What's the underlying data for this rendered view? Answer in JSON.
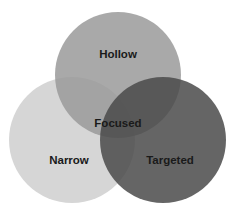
{
  "diagram": {
    "type": "venn",
    "circles": [
      {
        "id": "hollow",
        "label": "Hollow",
        "cx": 118,
        "cy": 75,
        "r": 63,
        "color": "#a0a0a0",
        "label_x": 118,
        "label_y": 58
      },
      {
        "id": "narrow",
        "label": "Narrow",
        "cx": 72,
        "cy": 140,
        "r": 63,
        "color": "#d8d8d8",
        "label_x": 69,
        "label_y": 164
      },
      {
        "id": "targeted",
        "label": "Targeted",
        "cx": 163,
        "cy": 140,
        "r": 63,
        "color": "#5e5e5e",
        "label_x": 170,
        "label_y": 164
      }
    ],
    "center_label": "Focused",
    "center_label_pos": {
      "x": 118,
      "y": 126
    }
  }
}
